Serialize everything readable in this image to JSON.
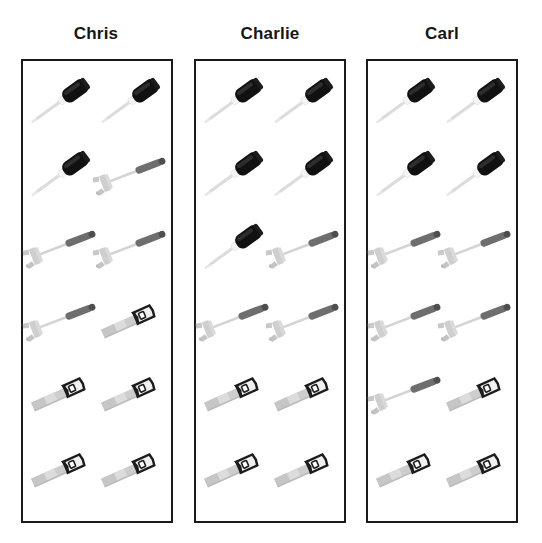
{
  "page": {
    "background_color": "#ffffff",
    "border_color": "#1a1a1a",
    "title_color": "#161616"
  },
  "tool_colors": {
    "screwdriver_handle": "#111111",
    "screwdriver_shaft": "#d8d8d8",
    "screwdriver_collar": "#f2f2f2",
    "hammer_grip": "#6e6e6e",
    "hammer_shaft": "#d5d5d5",
    "hammer_head": "#cfcfcf",
    "saw_blade": "#cccccc",
    "saw_blade_light": "#dcdcdc",
    "saw_handle": "#1c1c1c"
  },
  "columns": [
    {
      "id": "chris",
      "label": "Chris",
      "counts": {
        "screwdriver": 3,
        "hammer": 4,
        "saw": 5,
        "total": 12
      },
      "rows": [
        [
          "screwdriver",
          "screwdriver"
        ],
        [
          "screwdriver",
          "hammer"
        ],
        [
          "hammer",
          "hammer"
        ],
        [
          "hammer",
          "saw"
        ],
        [
          "saw",
          "saw"
        ],
        [
          "saw",
          "saw"
        ]
      ]
    },
    {
      "id": "charlie",
      "label": "Charlie",
      "counts": {
        "screwdriver": 5,
        "hammer": 3,
        "saw": 4,
        "total": 12
      },
      "rows": [
        [
          "screwdriver",
          "screwdriver"
        ],
        [
          "screwdriver",
          "screwdriver"
        ],
        [
          "screwdriver",
          "hammer"
        ],
        [
          "hammer",
          "hammer"
        ],
        [
          "saw",
          "saw"
        ],
        [
          "saw",
          "saw"
        ]
      ]
    },
    {
      "id": "carl",
      "label": "Carl",
      "counts": {
        "screwdriver": 4,
        "hammer": 5,
        "saw": 3,
        "total": 12
      },
      "rows": [
        [
          "screwdriver",
          "screwdriver"
        ],
        [
          "screwdriver",
          "screwdriver"
        ],
        [
          "hammer",
          "hammer"
        ],
        [
          "hammer",
          "hammer"
        ],
        [
          "hammer",
          "saw"
        ],
        [
          "saw",
          "saw"
        ]
      ]
    }
  ],
  "icon_names": {
    "screwdriver": "screwdriver-icon",
    "hammer": "hammer-icon",
    "saw": "saw-icon"
  }
}
